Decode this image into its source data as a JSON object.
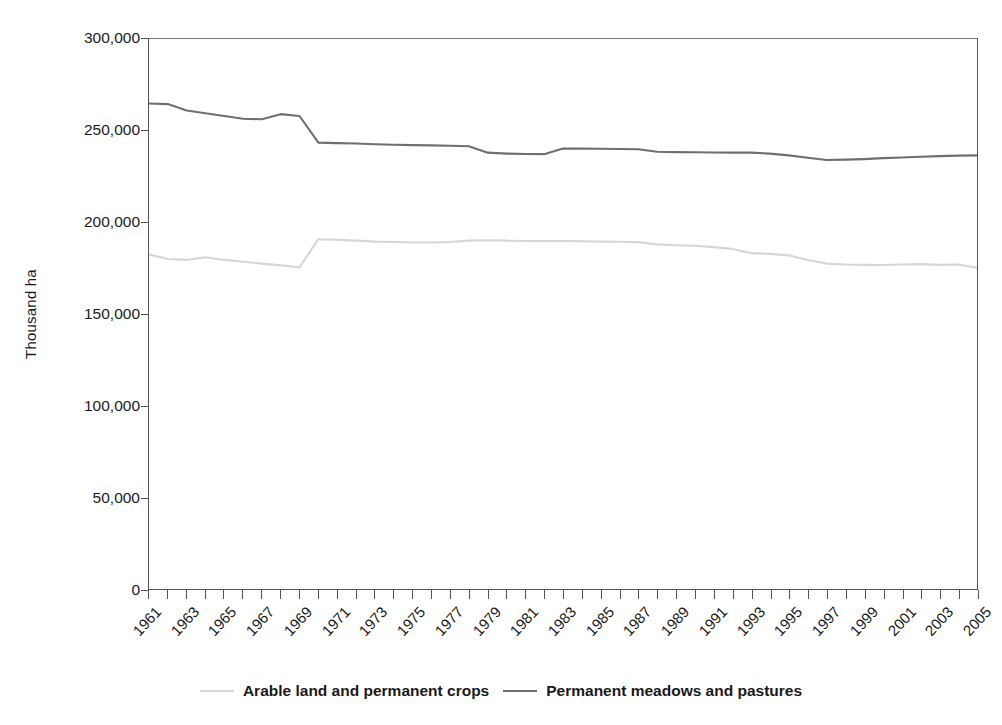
{
  "chart_data": {
    "type": "line",
    "title": "",
    "xlabel": "",
    "ylabel": "Thousand ha",
    "ylim": [
      0,
      300000
    ],
    "y_ticks": [
      "0",
      "50,000",
      "100,000",
      "150,000",
      "200,000",
      "250,000",
      "300,000"
    ],
    "y_tick_values": [
      0,
      50000,
      100000,
      150000,
      200000,
      250000,
      300000
    ],
    "grid": false,
    "legend_position": "bottom",
    "x": [
      1961,
      1962,
      1963,
      1964,
      1965,
      1966,
      1967,
      1968,
      1969,
      1970,
      1971,
      1972,
      1973,
      1974,
      1975,
      1976,
      1977,
      1978,
      1979,
      1980,
      1981,
      1982,
      1983,
      1984,
      1985,
      1986,
      1987,
      1988,
      1989,
      1990,
      1991,
      1992,
      1993,
      1994,
      1995,
      1996,
      1997,
      1998,
      1999,
      2000,
      2001,
      2002,
      2003,
      2004,
      2005
    ],
    "x_tick_labels": [
      "1961",
      "1963",
      "1965",
      "1967",
      "1969",
      "1971",
      "1973",
      "1975",
      "1977",
      "1979",
      "1981",
      "1983",
      "1985",
      "1987",
      "1989",
      "1991",
      "1993",
      "1995",
      "1997",
      "1999",
      "2001",
      "2003",
      "2005"
    ],
    "series": [
      {
        "name": "Arable land and permanent crops",
        "color": "#d6d6d6",
        "values": [
          182500,
          180000,
          179500,
          181000,
          179500,
          178500,
          177500,
          176500,
          175500,
          190800,
          190500,
          190000,
          189500,
          189300,
          189000,
          189000,
          189300,
          190000,
          190200,
          190000,
          189800,
          189800,
          189800,
          189700,
          189500,
          189400,
          189200,
          188000,
          187500,
          187200,
          186500,
          185500,
          183200,
          182800,
          182000,
          179500,
          177500,
          177000,
          176800,
          176700,
          177000,
          177200,
          176800,
          177000,
          175200
        ]
      },
      {
        "name": "Permanent meadows and pastures",
        "color": "#6f6f6f",
        "values": [
          264800,
          264500,
          261000,
          259500,
          258000,
          256500,
          256200,
          259000,
          258000,
          243500,
          243200,
          243000,
          242600,
          242300,
          242100,
          242000,
          241800,
          241500,
          238000,
          237500,
          237300,
          237200,
          240300,
          240200,
          240100,
          240000,
          239900,
          238500,
          238300,
          238200,
          238100,
          238000,
          238000,
          237500,
          236500,
          235200,
          234000,
          234200,
          234500,
          235000,
          235400,
          235800,
          236100,
          236400,
          236500
        ]
      }
    ]
  },
  "legend": {
    "items": [
      {
        "label": "Arable land and permanent crops",
        "color": "#d6d6d6"
      },
      {
        "label": "Permanent meadows and pastures",
        "color": "#6f6f6f"
      }
    ]
  }
}
